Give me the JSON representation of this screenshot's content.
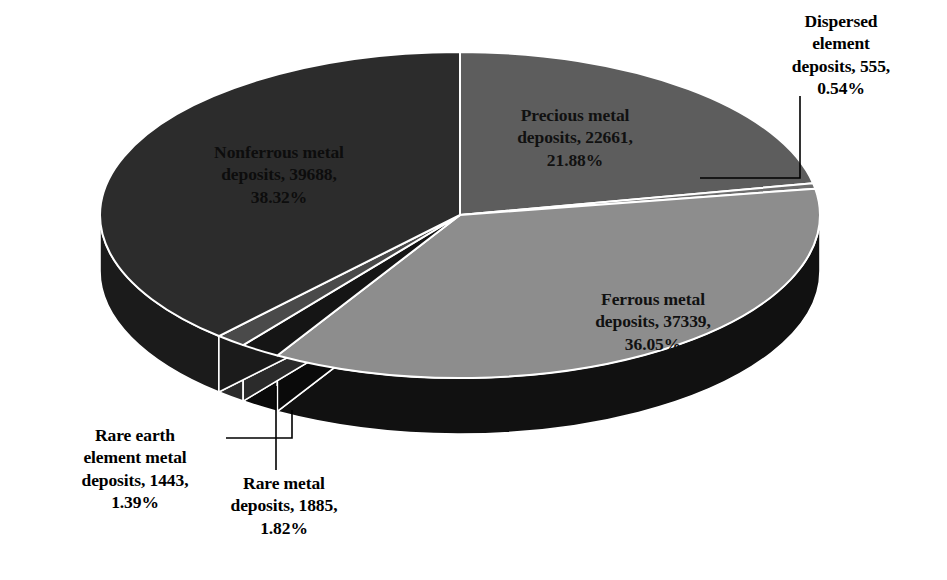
{
  "chart_data": {
    "type": "pie",
    "title": "",
    "subtitle": "",
    "xlabel": "",
    "ylabel": "",
    "three_d": true,
    "legend_position": "none",
    "label_format": "category, value, percent",
    "total": 103571,
    "categories": [
      "Precious metal deposits",
      "Dispersed element deposits",
      "Ferrous metal deposits",
      "Rare metal deposits",
      "Rare earth element metal deposits",
      "Nonferrous metal deposits"
    ],
    "values": [
      22661,
      555,
      37339,
      1885,
      1443,
      39688
    ],
    "percents": [
      21.88,
      0.54,
      36.05,
      1.82,
      1.39,
      38.32
    ],
    "slices": [
      {
        "name": "Precious metal deposits",
        "value": 22661,
        "percent": 21.88,
        "percent_label": "21.88%",
        "label": "Precious metal\ndeposits, 22661,\n21.88%",
        "top_color": "#5d5d5d",
        "side_color": "#3a3a3a",
        "label_placement": "inside"
      },
      {
        "name": "Dispersed element deposits",
        "value": 555,
        "percent": 0.54,
        "percent_label": "0.54%",
        "label": "Dispersed\nelement\ndeposits, 555,\n0.54%",
        "top_color": "#6e6e6e",
        "side_color": "#3a3a3a",
        "label_placement": "outside-leader"
      },
      {
        "name": "Ferrous metal deposits",
        "value": 37339,
        "percent": 36.05,
        "percent_label": "36.05%",
        "label": "Ferrous metal\ndeposits, 37339,\n36.05%",
        "top_color": "#8d8d8d",
        "side_color": "#111111",
        "label_placement": "inside"
      },
      {
        "name": "Rare metal deposits",
        "value": 1885,
        "percent": 1.82,
        "percent_label": "1.82%",
        "label": "Rare metal\ndeposits, 1885,\n1.82%",
        "top_color": "#151515",
        "side_color": "#0a0a0a",
        "label_placement": "outside-leader"
      },
      {
        "name": "Rare earth element metal deposits",
        "value": 1443,
        "percent": 1.39,
        "percent_label": "1.39%",
        "label": "Rare earth\nelement metal\ndeposits, 1443,\n1.39%",
        "top_color": "#4a4a4a",
        "side_color": "#2b2b2b",
        "label_placement": "outside-leader"
      },
      {
        "name": "Nonferrous metal deposits",
        "value": 39688,
        "percent": 38.32,
        "percent_label": "38.32%",
        "label": "Nonferrous metal\ndeposits, 39688,\n38.32%",
        "top_color": "#2c2c2c",
        "side_color": "#1b1b1b",
        "label_placement": "inside"
      }
    ],
    "colors": {
      "background": "#ffffff",
      "slice_outline": "#ffffff",
      "leader_line": "#000000",
      "label_text": "#000000"
    },
    "geometry": {
      "center_x": 460,
      "center_y": 215,
      "radius_x": 360,
      "radius_y": 163,
      "depth": 56,
      "start_angle_deg": -90
    }
  }
}
